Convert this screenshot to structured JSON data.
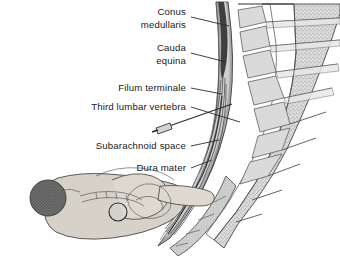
{
  "figure": {
    "background_color": "#ffffff",
    "ink_color": "#2b2b2b"
  },
  "labels": [
    {
      "id": "conus-medullaris",
      "line1": "Conus",
      "line2": "medullaris",
      "anchor_x": 212,
      "anchor_y": 12,
      "leader_to_x": 250,
      "leader_to_y": 24
    },
    {
      "id": "cauda-equina",
      "line1": "Cauda",
      "line2": "equina",
      "anchor_x": 212,
      "anchor_y": 48,
      "leader_to_x": 252,
      "leader_to_y": 60
    },
    {
      "id": "filum-terminale",
      "line1": "Filum terminale",
      "line2": "",
      "anchor_x": 212,
      "anchor_y": 88,
      "leader_to_x": 254,
      "leader_to_y": 88
    },
    {
      "id": "third-lumbar-vertebra",
      "line1": "Third lumbar vertebra",
      "line2": "",
      "anchor_x": 212,
      "anchor_y": 108,
      "leader_to_x": 262,
      "leader_to_y": 104
    },
    {
      "id": "subarachnoid-space",
      "line1": "Subarachnoid space",
      "line2": "",
      "anchor_x": 212,
      "anchor_y": 146,
      "leader_to_x": 243,
      "leader_to_y": 140
    },
    {
      "id": "dura-mater",
      "line1": "Dura mater",
      "line2": "",
      "anchor_x": 212,
      "anchor_y": 168,
      "leader_to_x": 236,
      "leader_to_y": 162
    }
  ],
  "colors": {
    "vertebral_body_fill": "#d8d8d8",
    "vertebral_stipple": "#8e8e8e",
    "canal_dark": "#5e5e5e",
    "cord_dark": "#3f3f3f",
    "dura_mid": "#9a9a9a",
    "csf_light": "#c9c9c9",
    "body_fill": "#d6d2c9",
    "hair_fill": "#6b6b6b",
    "outline": "#3a3a3a"
  },
  "annotations": {
    "needle_present": true,
    "needle_label": "spinal-needle",
    "puncture_site_marker": "circle",
    "patient_position": "lateral recumbent curled"
  }
}
